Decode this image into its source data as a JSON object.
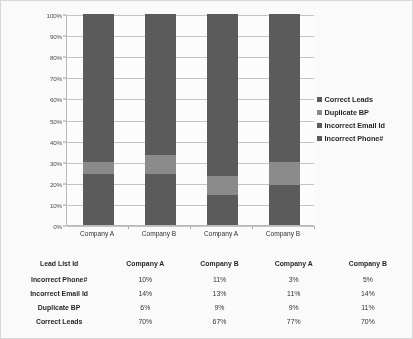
{
  "chart_data": {
    "type": "bar",
    "stacked": true,
    "normalized": "100%",
    "title": "",
    "xlabel": "",
    "ylabel": "",
    "ylim": [
      0,
      100
    ],
    "ytick_labels": [
      "0%",
      "10%",
      "20%",
      "30%",
      "40%",
      "50%",
      "60%",
      "70%",
      "80%",
      "90%",
      "100%"
    ],
    "ytick_values": [
      0,
      10,
      20,
      30,
      40,
      50,
      60,
      70,
      80,
      90,
      100
    ],
    "grid": true,
    "legend_position": "right",
    "categories": [
      "Company A",
      "Company B",
      "Company A",
      "Company B"
    ],
    "series": [
      {
        "name": "Incorrect Phone#",
        "values": [
          10,
          11,
          3,
          5
        ],
        "color": "#595959",
        "stack_order": 1
      },
      {
        "name": "Incorrect Email Id",
        "values": [
          14,
          13,
          11,
          14
        ],
        "color": "#595959",
        "stack_order": 2
      },
      {
        "name": "Duplicate BP",
        "values": [
          6,
          9,
          9,
          11
        ],
        "color": "#8a8a8a",
        "stack_order": 3
      },
      {
        "name": "Correct Leads",
        "values": [
          70,
          67,
          77,
          70
        ],
        "color": "#595959",
        "stack_order": 4
      }
    ]
  },
  "legend": {
    "items": [
      {
        "label": "Correct Leads",
        "color": "#595959"
      },
      {
        "label": "Duplicate BP",
        "color": "#8a8a8a"
      },
      {
        "label": "Incorrect Email Id",
        "color": "#595959"
      },
      {
        "label": "Incorrect Phone#",
        "color": "#595959"
      }
    ]
  },
  "table": {
    "headers": [
      "Lead  List  Id",
      "Company A",
      "Company B",
      "Company A",
      "Company B"
    ],
    "rows": [
      {
        "label": "Incorrect Phone#",
        "values": [
          "10%",
          "11%",
          "3%",
          "5%"
        ]
      },
      {
        "label": "Incorrect Email Id",
        "values": [
          "14%",
          "13%",
          "11%",
          "14%"
        ]
      },
      {
        "label": "Duplicate BP",
        "values": [
          "6%",
          "9%",
          "9%",
          "11%"
        ]
      },
      {
        "label": "Correct Leads",
        "values": [
          "70%",
          "67%",
          "77%",
          "70%"
        ]
      }
    ]
  },
  "colors": {
    "dark_gray": "#595959",
    "light_gray": "#8a8a8a",
    "gridline": "#c4c4c4",
    "axis": "#b9b9b9",
    "border": "#d8d8d8"
  }
}
